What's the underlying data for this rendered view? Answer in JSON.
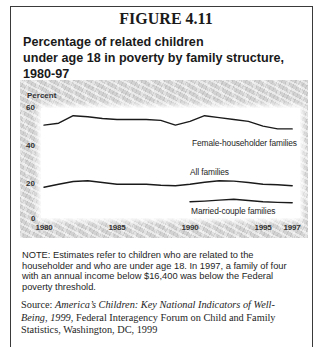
{
  "figure": {
    "label": "FIGURE 4.11",
    "title_lines": [
      "Percentage of related children",
      "under age 18 in poverty by family structure,",
      "1980-97"
    ]
  },
  "chart_data": {
    "type": "line",
    "title": "Percentage of related children under age 18 in poverty by family structure, 1980-97",
    "xlabel": "",
    "ylabel": "Percent",
    "x": [
      1980,
      1981,
      1982,
      1983,
      1984,
      1985,
      1986,
      1987,
      1988,
      1989,
      1990,
      1991,
      1992,
      1993,
      1994,
      1995,
      1996,
      1997
    ],
    "xticks": [
      "1980",
      "1985",
      "1990",
      "1995",
      "1997"
    ],
    "yticks": [
      "60",
      "40",
      "20",
      "0"
    ],
    "xlim": [
      1980,
      1997
    ],
    "ylim": [
      0,
      60
    ],
    "grid": false,
    "legend": "inline labels next to lines",
    "series": [
      {
        "name": "Female-householder families",
        "values": [
          51,
          52,
          56,
          55.5,
          54.5,
          54,
          54,
          54,
          53.5,
          51,
          53,
          56,
          55,
          54,
          53,
          50.5,
          49,
          49
        ]
      },
      {
        "name": "All families",
        "values": [
          18,
          19.5,
          21,
          21.4,
          20.5,
          19.6,
          19.5,
          19.5,
          19,
          18.7,
          19.5,
          20.6,
          21.4,
          21.2,
          20.5,
          19.6,
          19.3,
          18.8
        ]
      },
      {
        "name": "Married-couple families",
        "values": [
          null,
          null,
          null,
          null,
          null,
          null,
          null,
          null,
          null,
          null,
          10.2,
          10.6,
          11.1,
          11.6,
          10.9,
          10.2,
          9.9,
          9.7
        ]
      }
    ],
    "line_color": "#1a1a1a"
  },
  "note": {
    "lines": [
      "NOTE: Estimates refer to children who are related to the",
      "householder and who are under age 18. In 1997, a family of four",
      "with an annual income below $16,400 was below the Federal",
      "poverty threshold."
    ]
  },
  "source": {
    "prefix": "Source: ",
    "title_part1": "America’s Children: Key National Indicators of Well-",
    "title_part2": "Being, 1999",
    "rest_line2": ", Federal Interagency Forum on Child and Family",
    "rest_line3": "Statistics, Washington, DC, 1999"
  }
}
